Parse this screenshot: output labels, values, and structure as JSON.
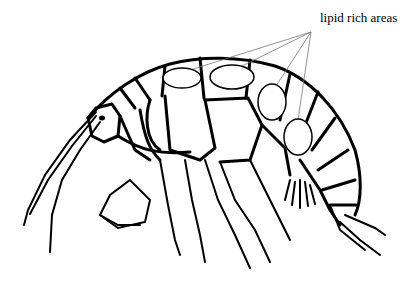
{
  "diagram": {
    "annotation": {
      "label": "lipid rich areas",
      "pointer_origin": [
        311,
        32
      ],
      "targets": [
        {
          "id": "lipid-area-1",
          "cx": 182,
          "cy": 78,
          "rx": 19,
          "ry": 10
        },
        {
          "id": "lipid-area-2",
          "cx": 232,
          "cy": 77,
          "rx": 22,
          "ry": 12
        },
        {
          "id": "lipid-area-3",
          "cx": 272,
          "cy": 102,
          "rx": 14,
          "ry": 18
        },
        {
          "id": "lipid-area-4",
          "cx": 298,
          "cy": 137,
          "rx": 14,
          "ry": 18
        }
      ]
    },
    "colors": {
      "line": "#000000",
      "pointer": "#777777",
      "background": "#ffffff"
    }
  }
}
